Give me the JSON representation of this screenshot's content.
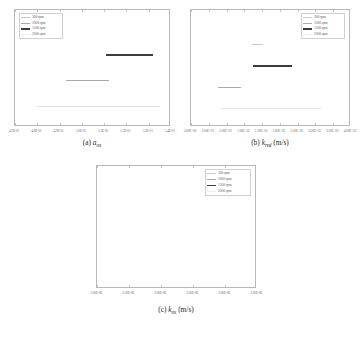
{
  "figure": {
    "panel_count": 3
  },
  "legend": {
    "entries": [
      {
        "label": "300 rpm",
        "color": "#c9c9c9",
        "thickness": 0.8
      },
      {
        "label": "1000 rpm",
        "color": "#aaaaaa",
        "thickness": 0.8
      },
      {
        "label": "1500 rpm",
        "color": "#3d3d3d",
        "thickness": 1.6
      },
      {
        "label": "2000 rpm",
        "color": "#e2e2e2",
        "thickness": 0.8
      }
    ]
  },
  "panels": [
    {
      "id": "a",
      "caption": {
        "index": "(a)",
        "symbol": "a",
        "subscript": "ox",
        "unit": ""
      },
      "legend_position": "left",
      "chart_data": {
        "type": "bar",
        "orientation": "horizontal-interval",
        "title": "",
        "xlabel": "",
        "ylabel": "",
        "grid": false,
        "legend_position": "top-left",
        "xlim": [
          0.47,
          0.54
        ],
        "xticks": [
          "4.7E-01",
          "4.8E-01",
          "4.9E-01",
          "5.0E-01",
          "5.1E-01",
          "5.2E-01",
          "5.3E-01",
          "5.4E-01"
        ],
        "xtick_values": [
          0.47,
          0.48,
          0.49,
          0.5,
          0.51,
          0.52,
          0.53,
          0.54
        ],
        "series": [
          {
            "name": "300 rpm",
            "x_start": 0.505,
            "x_end": 0.508,
            "y": 0.3,
            "visible": false
          },
          {
            "name": "1500 rpm",
            "x_start": 0.511,
            "x_end": 0.532,
            "y": 0.38,
            "visible": true
          },
          {
            "name": "1000 rpm",
            "x_start": 0.493,
            "x_end": 0.512,
            "y": 0.6,
            "visible": true
          },
          {
            "name": "2000 rpm",
            "x_start": 0.48,
            "x_end": 0.535,
            "y": 0.82,
            "visible": true
          }
        ]
      }
    },
    {
      "id": "b",
      "caption": {
        "index": "(b)",
        "symbol": "k",
        "subscript": "red",
        "unit": "(m/s)"
      },
      "legend_position": "right",
      "chart_data": {
        "type": "bar",
        "orientation": "horizontal-interval",
        "title": "",
        "xlabel": "",
        "ylabel": "",
        "grid": false,
        "legend_position": "top-right",
        "xlim": [
          5.0,
          4000.0
        ],
        "xticks": [
          "5.00E+00",
          "1.00E+01",
          "5.00E+02",
          "1.00E+02",
          "1.50E+03",
          "2.00E+03",
          "2.50E+03",
          "3.00E+03",
          "3.50E+03",
          "4.00E+03"
        ],
        "series": [
          {
            "name": "300 rpm",
            "x_start": 0.38,
            "x_end": 0.45,
            "y": 0.29,
            "visible": true
          },
          {
            "name": "1500 rpm",
            "x_start": 0.39,
            "x_end": 0.63,
            "y": 0.47,
            "visible": true
          },
          {
            "name": "1000 rpm",
            "x_start": 0.17,
            "x_end": 0.31,
            "y": 0.66,
            "visible": true
          },
          {
            "name": "2000 rpm",
            "x_start": 0.19,
            "x_end": 0.81,
            "y": 0.84,
            "visible": true
          }
        ]
      }
    },
    {
      "id": "c",
      "caption": {
        "index": "(c)",
        "symbol": "k",
        "subscript": "ox",
        "unit": "(m/s)"
      },
      "legend_position": "right",
      "chart_data": {
        "type": "bar",
        "orientation": "horizontal-interval",
        "title": "",
        "xlabel": "",
        "ylabel": "",
        "grid": false,
        "legend_position": "top-right",
        "xlim": [
          1e-08,
          3.5e-08
        ],
        "xticks": [
          "1.00E-08",
          "1.50E-08",
          "2.00E-08",
          "2.50E-08",
          "3.00E-08",
          "3.50E-08"
        ],
        "xtick_values": [
          1e-08,
          1.5e-08,
          2e-08,
          2.5e-08,
          3e-08,
          3.5e-08
        ],
        "series": [
          {
            "name": "300 rpm",
            "x_start": 0.085,
            "x_end": 0.175,
            "y": 0.235,
            "visible": true
          },
          {
            "name": "1500 rpm",
            "x_start": 0.115,
            "x_end": 0.425,
            "y": 0.455,
            "visible": true
          },
          {
            "name": "1000 rpm",
            "x_start": 0.075,
            "x_end": 0.245,
            "y": 0.655,
            "visible": true
          },
          {
            "name": "2000 rpm",
            "x_start": 0.055,
            "x_end": 0.965,
            "y": 0.885,
            "visible": true
          }
        ]
      }
    }
  ]
}
